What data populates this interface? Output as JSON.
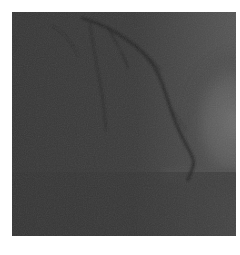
{
  "image": {
    "description": "Grayscale coronary angiogram (X-ray fluoroscopy) showing contrast-filled coronary artery branches over the cardiac silhouette",
    "colors": {
      "background_page": "#ffffff",
      "image_dark": "#363636",
      "image_mid": "#4a4a4a",
      "image_light": "#6e6e6e",
      "vessel": "#262626"
    }
  }
}
